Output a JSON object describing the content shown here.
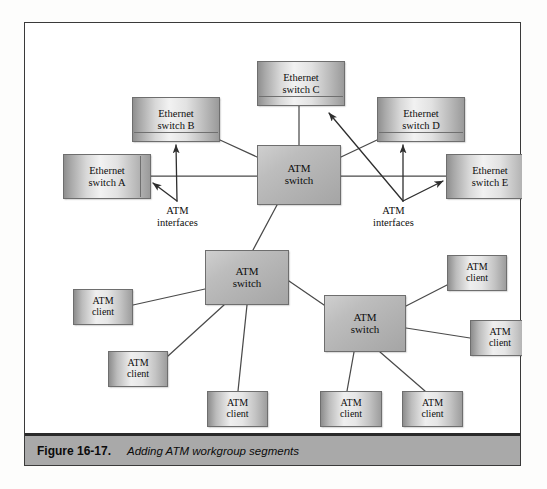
{
  "figure": {
    "caption_number": "Figure 16-17.",
    "caption_text": "Adding ATM workgroup segments"
  },
  "diagram": {
    "type": "network-topology",
    "nodes": [
      {
        "id": "eth-c",
        "label": "Ethernet\nswitch C",
        "kind": "ethernet-switch",
        "x": 232,
        "y": 38,
        "w": 88,
        "h": 45,
        "detail": "hbar"
      },
      {
        "id": "eth-b",
        "label": "Ethernet\nswitch B",
        "kind": "ethernet-switch",
        "x": 107,
        "y": 74,
        "w": 88,
        "h": 45,
        "detail": "hbar"
      },
      {
        "id": "eth-d",
        "label": "Ethernet\nswitch D",
        "kind": "ethernet-switch",
        "x": 352,
        "y": 74,
        "w": 88,
        "h": 45,
        "detail": "hbar"
      },
      {
        "id": "eth-a",
        "label": "Ethernet\nswitch A",
        "kind": "ethernet-switch",
        "x": 38,
        "y": 131,
        "w": 88,
        "h": 45,
        "detail": "vbar"
      },
      {
        "id": "eth-e",
        "label": "Ethernet\nswitch E",
        "kind": "ethernet-switch",
        "x": 421,
        "y": 131,
        "w": 88,
        "h": 45,
        "detail": "vbar"
      },
      {
        "id": "atm-core",
        "label": "ATM\nswitch",
        "kind": "atm-switch",
        "x": 232,
        "y": 122,
        "w": 84,
        "h": 60,
        "detail": "none"
      },
      {
        "id": "atm-mid",
        "label": "ATM\nswitch",
        "kind": "atm-switch",
        "x": 180,
        "y": 227,
        "w": 84,
        "h": 55,
        "detail": "none"
      },
      {
        "id": "atm-right",
        "label": "ATM\nswitch",
        "kind": "atm-switch",
        "x": 299,
        "y": 272,
        "w": 82,
        "h": 57,
        "detail": "none"
      },
      {
        "id": "cli-left",
        "label": "ATM\nclient",
        "kind": "atm-client",
        "x": 48,
        "y": 266,
        "w": 60,
        "h": 36,
        "detail": "none"
      },
      {
        "id": "cli-lower",
        "label": "ATM\nclient",
        "kind": "atm-client",
        "x": 83,
        "y": 328,
        "w": 60,
        "h": 36,
        "detail": "none"
      },
      {
        "id": "cli-bot1",
        "label": "ATM\nclient",
        "kind": "atm-client",
        "x": 182,
        "y": 368,
        "w": 61,
        "h": 36,
        "detail": "none"
      },
      {
        "id": "cli-bot2",
        "label": "ATM\nclient",
        "kind": "atm-client",
        "x": 295,
        "y": 368,
        "w": 62,
        "h": 36,
        "detail": "none"
      },
      {
        "id": "cli-bot3",
        "label": "ATM\nclient",
        "kind": "atm-client",
        "x": 377,
        "y": 368,
        "w": 61,
        "h": 36,
        "detail": "none"
      },
      {
        "id": "cli-rtop",
        "label": "ATM\nclient",
        "kind": "atm-client",
        "x": 422,
        "y": 232,
        "w": 60,
        "h": 36,
        "detail": "none"
      },
      {
        "id": "cli-rbot",
        "label": "ATM\nclient",
        "kind": "atm-client",
        "x": 445,
        "y": 297,
        "w": 60,
        "h": 36,
        "detail": "none"
      }
    ],
    "annotations": [
      {
        "id": "atm-if-left",
        "line1": "ATM",
        "line2": "interfaces",
        "x": 132,
        "y": 182
      },
      {
        "id": "atm-if-right",
        "line1": "ATM",
        "line2": "interfaces",
        "x": 348,
        "y": 182
      }
    ],
    "links": [
      {
        "from": "atm-core",
        "to": "eth-a",
        "style": "plain"
      },
      {
        "from": "atm-core",
        "to": "eth-b",
        "style": "plain"
      },
      {
        "from": "atm-core",
        "to": "eth-c",
        "style": "plain"
      },
      {
        "from": "atm-core",
        "to": "eth-d",
        "style": "plain"
      },
      {
        "from": "atm-core",
        "to": "eth-e",
        "style": "plain"
      },
      {
        "from": "atm-core",
        "to": "atm-mid",
        "style": "plain"
      },
      {
        "from": "atm-mid",
        "to": "atm-right",
        "style": "plain"
      },
      {
        "from": "atm-mid",
        "to": "cli-left",
        "style": "plain"
      },
      {
        "from": "atm-mid",
        "to": "cli-lower",
        "style": "plain"
      },
      {
        "from": "atm-mid",
        "to": "cli-bot1",
        "style": "plain"
      },
      {
        "from": "atm-right",
        "to": "cli-rtop",
        "style": "plain"
      },
      {
        "from": "atm-right",
        "to": "cli-rbot",
        "style": "plain"
      },
      {
        "from": "atm-right",
        "to": "cli-bot2",
        "style": "plain"
      },
      {
        "from": "atm-right",
        "to": "cli-bot3",
        "style": "plain"
      }
    ],
    "interface_arrows": [
      {
        "from": "atm-if-left",
        "to": "eth-a"
      },
      {
        "from": "atm-if-left",
        "to": "eth-b"
      },
      {
        "from": "atm-if-right",
        "to": "eth-c"
      },
      {
        "from": "atm-if-right",
        "to": "eth-d"
      },
      {
        "from": "atm-if-right",
        "to": "eth-e"
      }
    ]
  },
  "colors": {
    "frame_border": "#3a3a3a",
    "caption_bar": "#a9a9a9",
    "caption_rule": "#2a2a2a",
    "wire": "#4a4a4a",
    "node_border": "#6e6e6e",
    "page_background": "#fdfdfc"
  }
}
